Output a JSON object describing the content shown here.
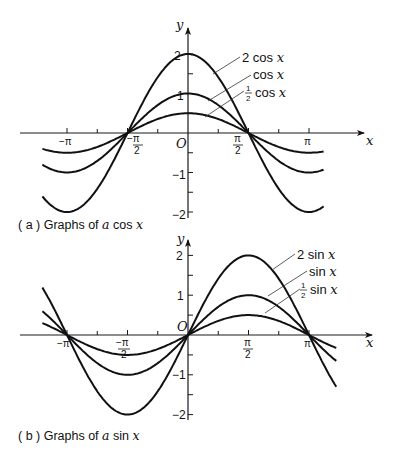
{
  "chart_data": [
    {
      "id": "a",
      "type": "line",
      "caption": {
        "prefix": "( a ) Graphs of ",
        "var": "a",
        "suffix": " cos x"
      },
      "title": "Graphs of a cos x",
      "xlabel": "x",
      "ylabel": "y",
      "xlim": [
        -3.8,
        3.6
      ],
      "ylim": [
        -2.2,
        2.6
      ],
      "grid": false,
      "x_ticks": [
        {
          "value": -3.1416,
          "label": "−π"
        },
        {
          "value": -1.5708,
          "label": "−π/2"
        },
        {
          "value": 0,
          "label": "O"
        },
        {
          "value": 1.5708,
          "label": "π/2"
        },
        {
          "value": 3.1416,
          "label": "π"
        }
      ],
      "y_ticks": [
        {
          "value": 2,
          "label": "2"
        },
        {
          "value": 1,
          "label": "1"
        },
        {
          "value": -1,
          "label": "−1"
        },
        {
          "value": -2,
          "label": "−2"
        }
      ],
      "series": [
        {
          "name": "2 cos x",
          "amplitude": 2,
          "func": "cos",
          "label_parts": {
            "coef": "2",
            "fn": "cos",
            "var": "x"
          }
        },
        {
          "name": "cos x",
          "amplitude": 1,
          "func": "cos",
          "label_parts": {
            "coef": "",
            "fn": "cos",
            "var": "x"
          }
        },
        {
          "name": "1/2 cos x",
          "amplitude": 0.5,
          "func": "cos",
          "label_parts": {
            "coef": "1/2",
            "fn": "cos",
            "var": "x"
          }
        }
      ]
    },
    {
      "id": "b",
      "type": "line",
      "caption": {
        "prefix": "( b ) Graphs of ",
        "var": "a",
        "suffix": " sin x"
      },
      "title": "Graphs of a sin x",
      "xlabel": "x",
      "ylabel": "y",
      "xlim": [
        -3.8,
        3.9
      ],
      "ylim": [
        -2.1,
        2.4
      ],
      "grid": false,
      "x_ticks": [
        {
          "value": -3.1416,
          "label": "−π"
        },
        {
          "value": -1.5708,
          "label": "−π/2"
        },
        {
          "value": 0,
          "label": "O"
        },
        {
          "value": 1.5708,
          "label": "π/2"
        },
        {
          "value": 3.1416,
          "label": "π"
        }
      ],
      "y_ticks": [
        {
          "value": 2,
          "label": "2"
        },
        {
          "value": 1,
          "label": "1"
        },
        {
          "value": -1,
          "label": "−1"
        },
        {
          "value": -2,
          "label": "−2"
        }
      ],
      "series": [
        {
          "name": "2 sin x",
          "amplitude": 2,
          "func": "sin",
          "label_parts": {
            "coef": "2",
            "fn": "sin",
            "var": "x"
          }
        },
        {
          "name": "sin x",
          "amplitude": 1,
          "func": "sin",
          "label_parts": {
            "coef": "",
            "fn": "sin",
            "var": "x"
          }
        },
        {
          "name": "1/2 sin x",
          "amplitude": 0.5,
          "func": "sin",
          "label_parts": {
            "coef": "1/2",
            "fn": "sin",
            "var": "x"
          }
        }
      ]
    }
  ],
  "labels": {
    "a": {
      "y_axis": "y",
      "x_axis": "x",
      "origin": "O",
      "neg_pi": "−π",
      "pi": "π",
      "pi_sym": "π",
      "half_den": "2",
      "y2": "2",
      "y1": "1",
      "yn1": "−1",
      "yn2": "−2",
      "s2_coef": "2",
      "s2_fn": "cos",
      "s1_fn": "cos",
      "sh_fn": "cos",
      "var": "x",
      "frac_num": "1",
      "frac_den": "2",
      "cap_prefix": "( a ) Graphs of ",
      "cap_var": "a",
      "cap_fn": "cos",
      "cap_x": "x"
    },
    "b": {
      "y_axis": "y",
      "x_axis": "x",
      "origin": "O",
      "neg_pi": "−π",
      "pi": "π",
      "pi_sym": "π",
      "half_den": "2",
      "y2": "2",
      "y1": "1",
      "yn1": "−1",
      "yn2": "−2",
      "s2_coef": "2",
      "s2_fn": "sin",
      "s1_fn": "sin",
      "sh_fn": "sin",
      "var": "x",
      "frac_num": "1",
      "frac_den": "2",
      "cap_prefix": "( b ) Graphs of ",
      "cap_var": "a",
      "cap_fn": "sin",
      "cap_x": "x"
    }
  },
  "colors": {
    "ink": "#111111",
    "background": "#ffffff"
  }
}
